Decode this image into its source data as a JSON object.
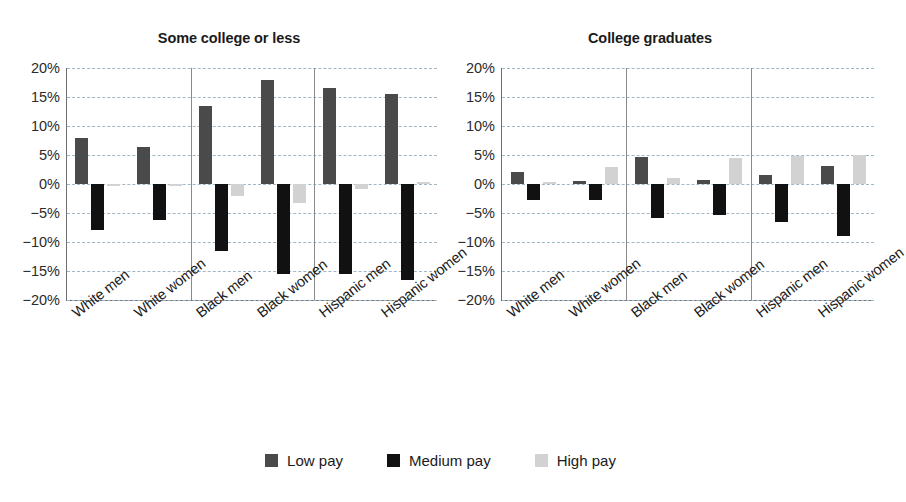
{
  "chart_data": {
    "type": "bar",
    "title": "",
    "panels": [
      {
        "title": "Some college or less",
        "categories": [
          "White men",
          "White women",
          "Black men",
          "Black women",
          "Hispanic men",
          "Hispanic women"
        ],
        "series": [
          {
            "name": "Low pay",
            "color": "#4a4a4a",
            "values": [
              8.0,
              6.3,
              13.5,
              18.0,
              16.5,
              15.5
            ]
          },
          {
            "name": "Medium pay",
            "color": "#111111",
            "values": [
              -8.0,
              -6.2,
              -11.5,
              -15.5,
              -15.5,
              -16.5
            ]
          },
          {
            "name": "High pay",
            "color": "#d2d2d2",
            "values": [
              -0.3,
              -0.3,
              -2.0,
              -3.3,
              -0.9,
              0.4
            ]
          }
        ]
      },
      {
        "title": "College graduates",
        "categories": [
          "White men",
          "White women",
          "Black men",
          "Black women",
          "Hispanic men",
          "Hispanic women"
        ],
        "series": [
          {
            "name": "Low pay",
            "color": "#4a4a4a",
            "values": [
              2.1,
              0.5,
              4.6,
              0.7,
              1.5,
              3.1
            ]
          },
          {
            "name": "Medium pay",
            "color": "#111111",
            "values": [
              -2.8,
              -2.7,
              -5.9,
              -5.3,
              -6.6,
              -8.9
            ]
          },
          {
            "name": "High pay",
            "color": "#d2d2d2",
            "values": [
              0.3,
              2.9,
              1.1,
              4.5,
              4.8,
              5.0
            ]
          }
        ]
      }
    ],
    "yticks": [
      "20%",
      "15%",
      "10%",
      "5%",
      "0%",
      "-5%",
      "-10%",
      "-15%",
      "-20%"
    ],
    "ytick_values": [
      20,
      15,
      10,
      5,
      0,
      -5,
      -10,
      -15,
      -20
    ],
    "ylim": [
      -20,
      20
    ],
    "ylabel": "",
    "xlabel": "",
    "grid": true,
    "legend_position": "bottom",
    "legend": [
      {
        "label": "Low pay",
        "color": "#4a4a4a"
      },
      {
        "label": "Medium pay",
        "color": "#111111"
      },
      {
        "label": "High pay",
        "color": "#d2d2d2"
      }
    ]
  }
}
